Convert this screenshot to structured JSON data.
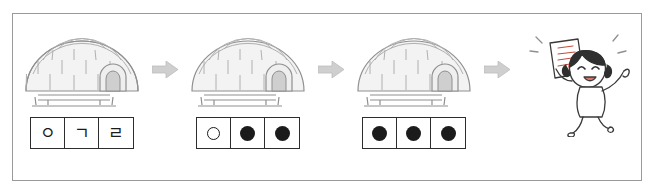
{
  "diagram": {
    "frame_border_color": "#9a9a9a",
    "ink_color": "#1b1b1b",
    "arrow_color": "#c9c9c9",
    "steps": [
      {
        "id": "step-1",
        "scene": "igloo-with-sled",
        "arrow_after": "arrow-right",
        "tiles": [
          {
            "type": "glyph",
            "label": "ㅇ"
          },
          {
            "type": "glyph",
            "label": "ㄱ"
          },
          {
            "type": "glyph",
            "label": "ㄹ"
          }
        ]
      },
      {
        "id": "step-2",
        "scene": "igloo-with-sled",
        "arrow_after": "arrow-right",
        "tiles": [
          {
            "type": "dot-empty",
            "label": ""
          },
          {
            "type": "dot-filled",
            "label": ""
          },
          {
            "type": "dot-filled",
            "label": ""
          }
        ]
      },
      {
        "id": "step-3",
        "scene": "igloo-with-sled",
        "arrow_after": "arrow-right",
        "tiles": [
          {
            "type": "dot-filled",
            "label": ""
          },
          {
            "type": "dot-filled",
            "label": ""
          },
          {
            "type": "dot-filled",
            "label": ""
          }
        ]
      },
      {
        "id": "step-4",
        "scene": "girl-with-paper",
        "arrow_after": "",
        "tiles": []
      }
    ]
  }
}
